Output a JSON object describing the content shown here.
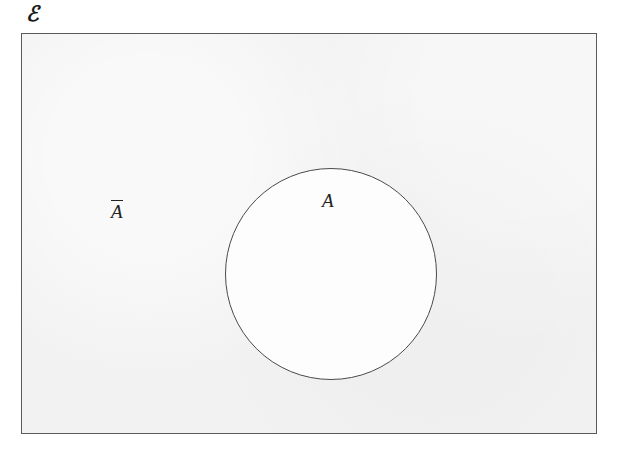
{
  "diagram": {
    "type": "venn",
    "universe": {
      "label": "ℰ",
      "name": "universal-set",
      "shape": "rectangle",
      "fill_color": "#f2f2f2",
      "stroke_color": "#5a5a5a"
    },
    "sets": [
      {
        "label": "A",
        "name": "set-a",
        "shape": "circle",
        "fill_color": "#fdfdfd",
        "stroke_color": "#4a4a4a"
      }
    ],
    "regions": [
      {
        "label": "A",
        "name": "region-a",
        "description": "interior of circle A"
      },
      {
        "label": "A",
        "overline": true,
        "name": "region-a-complement",
        "description": "inside universal set but outside circle A"
      }
    ],
    "background_color": "#ffffff"
  }
}
